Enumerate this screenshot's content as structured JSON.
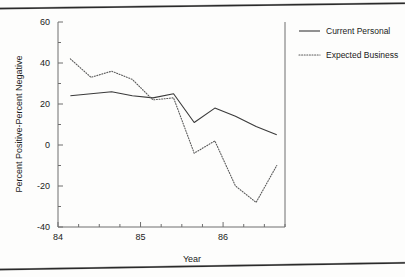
{
  "chart_data": {
    "type": "line",
    "title": "",
    "xlabel": "Year",
    "ylabel": "Percent Positive-Percent Negative",
    "xlim": [
      84.0,
      86.75
    ],
    "ylim": [
      -40,
      60
    ],
    "xticks": [
      "84",
      "85",
      "86"
    ],
    "xtick_values": [
      84,
      85,
      86
    ],
    "yticks": [
      "60",
      "40",
      "20",
      "0",
      "-20",
      "-40"
    ],
    "ytick_values": [
      60,
      40,
      20,
      0,
      -20,
      -40
    ],
    "minor_ticks": true,
    "grid": false,
    "legend_position": "right",
    "x": [
      84.15,
      84.4,
      84.65,
      84.9,
      85.15,
      85.4,
      85.65,
      85.9,
      86.15,
      86.4,
      86.65
    ],
    "series": [
      {
        "name": "Current Personal",
        "style": "solid",
        "color": "#3a3a3a",
        "values": [
          24,
          25,
          26,
          24,
          23,
          25,
          11,
          18,
          14,
          9,
          5
        ]
      },
      {
        "name": "Expected Business",
        "style": "dotted",
        "color": "#5a5a5a",
        "values": [
          42,
          33,
          36,
          32,
          22,
          23,
          -4,
          2,
          -20,
          -28,
          -10
        ]
      }
    ]
  },
  "legend": {
    "items": [
      {
        "label": "Current Personal"
      },
      {
        "label": "Expected Business"
      }
    ]
  },
  "axes": {
    "x_title": "Year",
    "y_title": "Percent Positive-Percent Negative"
  }
}
